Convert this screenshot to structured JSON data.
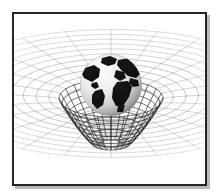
{
  "figure": {
    "title": "Spacetime curvature around Earth",
    "frame": {
      "border_color": "#26262a",
      "border_width_px": 2,
      "shadow_color": "#b9b9bd",
      "background": "#ffffff",
      "x": 12,
      "y": 12,
      "width": 195,
      "height": 174
    },
    "colors": {
      "grid_line": "#6e6e73",
      "grid_line_faint": "#a8a8ad",
      "well_line": "#1c1c1f",
      "ocean_light": "#f2f2f0",
      "ocean_mid": "#d6d6d2",
      "land": "#121214",
      "terminator_shadow": "#8e8e8c",
      "page_background": "#ffffff"
    },
    "globe": {
      "label": "Earth",
      "center_x": 97,
      "center_y": 71,
      "radius_px": 31,
      "visible_landmasses": [
        "North America",
        "Greenland",
        "South America",
        "Europe",
        "Africa",
        "Asia"
      ],
      "lighting": "upper-left highlight, lower-right shadow"
    },
    "grid": {
      "type": "polar-wireframe",
      "description": "Concentric rings and radial spokes on a warped sheet",
      "ring_count": 14,
      "spoke_count": 24,
      "projection": "perspective, viewed from above the plane",
      "outer_plane_visible": true
    },
    "gravity_well": {
      "label": "Gravity well",
      "description": "Funnel depression beneath the globe",
      "depth_px": 62,
      "mouth_radius_px": 52,
      "throat_radius_px": 19,
      "center_x": 97,
      "center_y": 78,
      "ring_count": 9,
      "spoke_count": 24
    },
    "annotations": []
  }
}
